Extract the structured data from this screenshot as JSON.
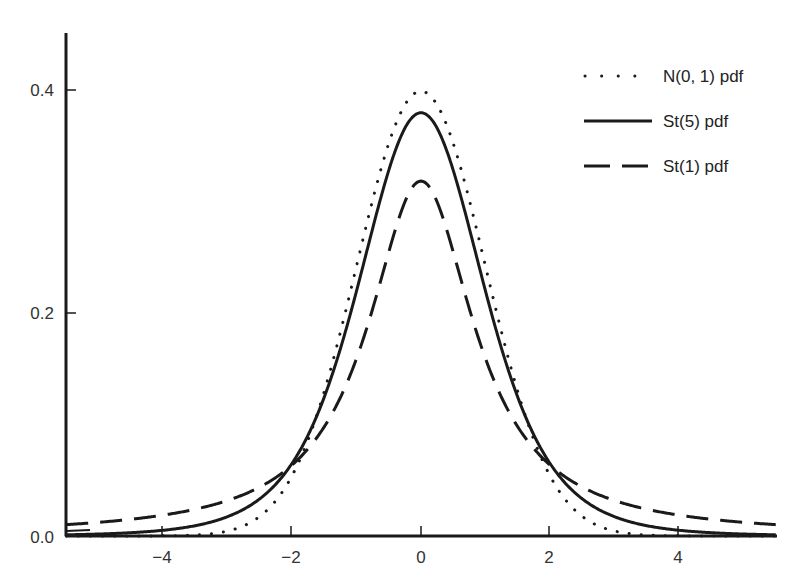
{
  "chart_data": {
    "type": "line",
    "title": "",
    "xlabel": "",
    "ylabel": "",
    "xlim": [
      -5.5,
      5.5
    ],
    "ylim": [
      0.0,
      0.45
    ],
    "grid": false,
    "legend_position": "upper right",
    "x_ticks": [
      -4,
      -2,
      0,
      2,
      4
    ],
    "x_tick_labels": [
      "−4",
      "−2",
      "0",
      "2",
      "4"
    ],
    "y_ticks": [
      0.0,
      0.2,
      0.4
    ],
    "y_tick_labels": [
      "0.0",
      "0.2",
      "0.4"
    ],
    "series": [
      {
        "name": "N(0, 1) pdf",
        "style": "dotted",
        "color": "#1a1a1a",
        "formula": "exp(-x^2/2)/sqrt(2*pi)",
        "x": [
          -5,
          -4,
          -3,
          -2,
          -1,
          0,
          1,
          2,
          3,
          4,
          5
        ],
        "values": [
          0.0,
          0.0001,
          0.0044,
          0.054,
          0.242,
          0.3989,
          0.242,
          0.054,
          0.0044,
          0.0001,
          0.0
        ]
      },
      {
        "name": "St(5) pdf",
        "style": "solid",
        "color": "#1a1a1a",
        "formula": "Student t, 5 degrees of freedom",
        "x": [
          -5,
          -4,
          -3,
          -2,
          -1,
          0,
          1,
          2,
          3,
          4,
          5
        ],
        "values": [
          0.0018,
          0.0051,
          0.0173,
          0.0651,
          0.2197,
          0.3796,
          0.2197,
          0.0651,
          0.0173,
          0.0051,
          0.0018
        ]
      },
      {
        "name": "St(1) pdf",
        "style": "dashed",
        "color": "#1a1a1a",
        "formula": "Student t, 1 degree of freedom (Cauchy)",
        "x": [
          -5,
          -4,
          -3,
          -2,
          -1,
          0,
          1,
          2,
          3,
          4,
          5
        ],
        "values": [
          0.0122,
          0.0187,
          0.0318,
          0.0637,
          0.1592,
          0.3183,
          0.1592,
          0.0637,
          0.0318,
          0.0187,
          0.0122
        ]
      }
    ]
  },
  "legend": {
    "items": [
      {
        "label": "N(0, 1) pdf",
        "style": "dotted"
      },
      {
        "label": "St(5) pdf",
        "style": "solid"
      },
      {
        "label": "St(1) pdf",
        "style": "dashed"
      }
    ]
  },
  "axes": {
    "x_labels": [
      "−4",
      "−2",
      "0",
      "2",
      "4"
    ],
    "y_labels": [
      "0.0",
      "0.2",
      "0.4"
    ]
  }
}
